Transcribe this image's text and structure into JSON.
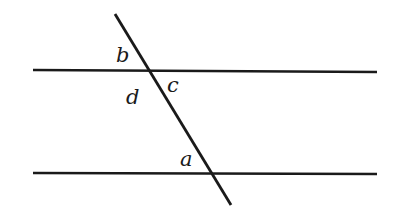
{
  "diagram": {
    "type": "parallel-lines-transversal",
    "stroke_color": "#1a1a1a",
    "lines": {
      "top": {
        "x1": 33,
        "y1": 70,
        "x2": 377,
        "y2": 72
      },
      "bottom": {
        "x1": 33,
        "y1": 173,
        "x2": 377,
        "y2": 174
      },
      "transversal": {
        "x1": 115,
        "y1": 14,
        "x2": 231,
        "y2": 205
      }
    },
    "labels": [
      {
        "id": "b",
        "text": "b",
        "x": 116,
        "y": 62
      },
      {
        "id": "c",
        "text": "c",
        "x": 167,
        "y": 92
      },
      {
        "id": "d",
        "text": "d",
        "x": 126,
        "y": 104
      },
      {
        "id": "a",
        "text": "a",
        "x": 180,
        "y": 166
      }
    ]
  }
}
